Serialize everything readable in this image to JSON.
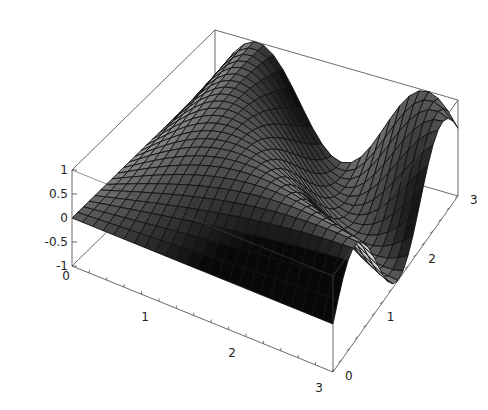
{
  "chart_data": {
    "type": "surface",
    "title": "",
    "function": "sin(x*y)",
    "x_range": [
      0,
      3
    ],
    "y_range": [
      0,
      3
    ],
    "z_range": [
      -1,
      1
    ],
    "grid_lines": 25,
    "x_ticks": [
      "1",
      "2",
      "3"
    ],
    "x_tick_values": [
      1,
      2,
      3
    ],
    "x_origin_label": "0",
    "y_ticks": [
      "0",
      "1",
      "2",
      "3"
    ],
    "y_tick_values": [
      0,
      1,
      2,
      3
    ],
    "z_ticks": [
      "1",
      "0.5",
      "0",
      "-0.5",
      "-1"
    ],
    "z_tick_values": [
      1,
      0.5,
      0,
      -0.5,
      -1
    ],
    "xlabel": "",
    "ylabel": "",
    "zlabel": "",
    "box": true,
    "shading": "grayscale-lit"
  },
  "colors": {
    "box": "#444444",
    "mesh": "#111111",
    "background": "#ffffff"
  }
}
